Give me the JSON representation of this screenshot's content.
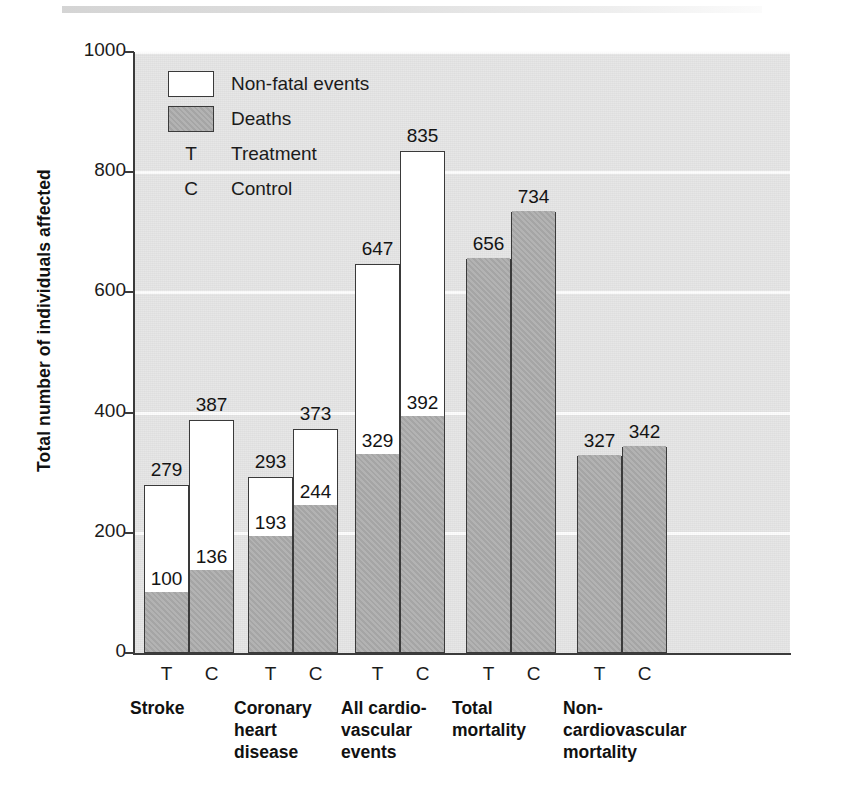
{
  "figure": {
    "background_color": "#ffffff",
    "plot_background_color": "#e4e4e4",
    "gridline_color": "#fdfdfd",
    "deaths_color": "#aaaaaa",
    "nonfatal_color": "#ffffff",
    "outline_color": "#3a3a3a"
  },
  "legend": {
    "items": [
      {
        "key": "",
        "swatch": "white",
        "label": "Non-fatal events"
      },
      {
        "key": "",
        "swatch": "gray",
        "label": "Deaths"
      },
      {
        "key": "T",
        "swatch": "none",
        "label": "Treatment"
      },
      {
        "key": "C",
        "swatch": "none",
        "label": "Control"
      }
    ]
  },
  "chart_data": {
    "type": "bar",
    "subtype": "stacked-grouped",
    "title": "",
    "xlabel": "",
    "ylabel": "Total number of individuals affected",
    "ylim": [
      0,
      1000
    ],
    "yticks": [
      0,
      200,
      400,
      600,
      800,
      1000
    ],
    "ytick_labels": [
      "0",
      "200",
      "400",
      "600",
      "800",
      "1000"
    ],
    "grid": true,
    "grid_axis": "y",
    "legend_position": "upper-left-inside",
    "arm_labels": [
      "T",
      "C"
    ],
    "arm_names": [
      "Treatment",
      "Control"
    ],
    "categories": [
      "Stroke",
      "Coronary heart disease",
      "All cardiovascular events",
      "Total mortality",
      "Non-cardiovascular mortality"
    ],
    "category_display_lines": [
      [
        "Stroke"
      ],
      [
        "Coronary",
        "heart",
        "disease"
      ],
      [
        "All cardio-",
        "vascular",
        "events"
      ],
      [
        "Total",
        "mortality"
      ],
      [
        "Non-",
        "cardiovascular",
        "mortality"
      ]
    ],
    "series": [
      {
        "name": "Deaths",
        "stack_order": 0
      },
      {
        "name": "Non-fatal events",
        "stack_order": 1
      }
    ],
    "bars": [
      {
        "category": "Stroke",
        "arm": "T",
        "total": 279,
        "deaths": 100,
        "nonfatal": 179,
        "total_label": "279",
        "deaths_label": "100"
      },
      {
        "category": "Stroke",
        "arm": "C",
        "total": 387,
        "deaths": 136,
        "nonfatal": 251,
        "total_label": "387",
        "deaths_label": "136"
      },
      {
        "category": "Coronary heart disease",
        "arm": "T",
        "total": 293,
        "deaths": 193,
        "nonfatal": 100,
        "total_label": "293",
        "deaths_label": "193"
      },
      {
        "category": "Coronary heart disease",
        "arm": "C",
        "total": 373,
        "deaths": 244,
        "nonfatal": 129,
        "total_label": "373",
        "deaths_label": "244"
      },
      {
        "category": "All cardiovascular events",
        "arm": "T",
        "total": 647,
        "deaths": 329,
        "nonfatal": 318,
        "total_label": "647",
        "deaths_label": "329"
      },
      {
        "category": "All cardiovascular events",
        "arm": "C",
        "total": 835,
        "deaths": 392,
        "nonfatal": 443,
        "total_label": "835",
        "deaths_label": "392"
      },
      {
        "category": "Total mortality",
        "arm": "T",
        "total": 656,
        "deaths": 656,
        "nonfatal": 0,
        "total_label": "656",
        "deaths_label": ""
      },
      {
        "category": "Total mortality",
        "arm": "C",
        "total": 734,
        "deaths": 734,
        "nonfatal": 0,
        "total_label": "734",
        "deaths_label": ""
      },
      {
        "category": "Non-cardiovascular mortality",
        "arm": "T",
        "total": 327,
        "deaths": 327,
        "nonfatal": 0,
        "total_label": "327",
        "deaths_label": ""
      },
      {
        "category": "Non-cardiovascular mortality",
        "arm": "C",
        "total": 342,
        "deaths": 342,
        "nonfatal": 0,
        "total_label": "342",
        "deaths_label": ""
      }
    ]
  }
}
